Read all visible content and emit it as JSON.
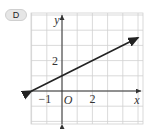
{
  "option_label": "D",
  "chart_data": {
    "type": "line",
    "title": "",
    "xlabel": "x",
    "ylabel": "y",
    "origin_label": "O",
    "x_tick_labels": [
      {
        "value": -1,
        "label": "-1"
      },
      {
        "value": 2,
        "label": "2"
      }
    ],
    "y_tick_labels": [
      {
        "value": 2,
        "label": "2"
      }
    ],
    "xlim": [
      -2,
      5.2
    ],
    "ylim": [
      -2.2,
      5.2
    ],
    "grid": true,
    "series": [
      {
        "name": "line",
        "equation": "y = 0.5x + 1",
        "slope": 0.5,
        "intercept": 1,
        "x": [
          -2,
          5
        ],
        "y": [
          0,
          3.5
        ],
        "arrows": "both"
      }
    ],
    "colors": {
      "grid": "#d0d0d0",
      "axis": "#333333",
      "line": "#222222"
    }
  }
}
